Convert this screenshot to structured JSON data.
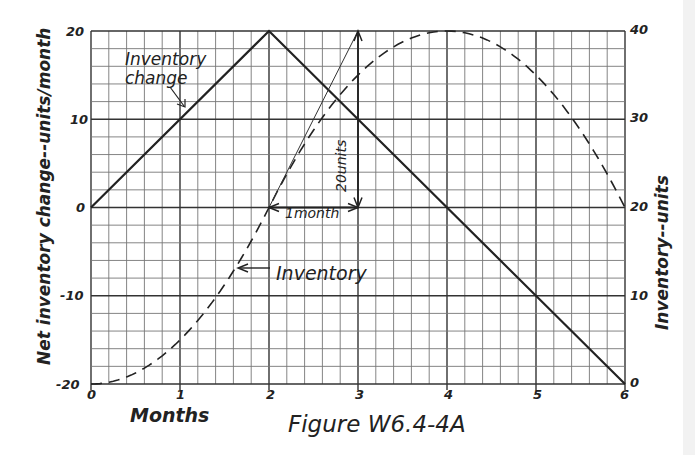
{
  "chart_data": {
    "type": "line",
    "title": "Figure W6.4-4A",
    "xlabel": "Months",
    "ylabel": "Net inventory change--units/month",
    "ylabel_right": "Inventory--units",
    "x_ticks": [
      "0",
      "1",
      "2",
      "3",
      "4",
      "5",
      "6"
    ],
    "y_ticks_left": [
      "-20",
      "-10",
      "0",
      "10",
      "20"
    ],
    "y_ticks_right": [
      "0",
      "10",
      "20",
      "30",
      "40"
    ],
    "xlim": [
      0,
      6
    ],
    "ylim_left": [
      -20,
      20
    ],
    "ylim_right": [
      0,
      40
    ],
    "grid": true,
    "series": [
      {
        "name": "Inventory change",
        "axis": "left",
        "style": "solid",
        "x": [
          0,
          2,
          6
        ],
        "values": [
          0,
          20,
          -20
        ]
      },
      {
        "name": "Inventory",
        "axis": "right",
        "style": "dashed",
        "x": [
          0,
          0.5,
          1,
          1.5,
          2,
          2.5,
          3,
          3.5,
          4,
          4.5,
          5,
          5.5,
          6
        ],
        "values": [
          0,
          1.25,
          5,
          11.25,
          20,
          28.75,
          35,
          38.75,
          40,
          38.75,
          35,
          28.75,
          20
        ]
      }
    ],
    "annotations": [
      {
        "text": "Inventory change",
        "points_to": "Inventory change line near x=1"
      },
      {
        "text": "Inventory",
        "points_to": "Inventory curve near x=1.6"
      },
      {
        "text": "1month",
        "type": "horizontal dimension",
        "from_x": 2,
        "to_x": 3,
        "y_left": 0
      },
      {
        "text": "20units",
        "type": "vertical dimension",
        "x": 3,
        "from_y_left": 0,
        "to_y_left": 20
      },
      {
        "type": "tangent line",
        "from": [
          2,
          0
        ],
        "to": [
          3,
          20
        ],
        "note": "slope of inventory at t=2"
      }
    ]
  },
  "labels": {
    "figure_caption": "Figure W6.4-4A",
    "x_axis_title": "Months",
    "y_left_title": "Net inventory change--units/month",
    "y_right_title": "Inventory--units",
    "annotation_inventory_change_1": "Inventory",
    "annotation_inventory_change_2": "change",
    "annotation_inventory": "Inventory",
    "annotation_month": "1month",
    "annotation_units": "20units",
    "x_ticks": [
      "0",
      "1",
      "2",
      "3",
      "4",
      "5",
      "6"
    ],
    "y_left_ticks": [
      "20",
      "10",
      "0",
      "-10",
      "-20"
    ],
    "y_right_ticks": [
      "40",
      "30",
      "20",
      "10",
      "0"
    ]
  }
}
